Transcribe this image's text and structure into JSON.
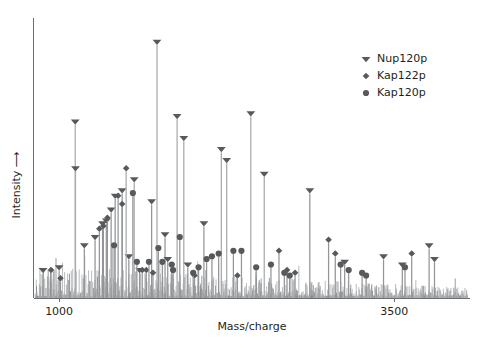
{
  "chart_data": {
    "type": "line",
    "title": "",
    "subtitle": "",
    "xlabel": "Mass/charge",
    "ylabel": "Intensity ⟶",
    "xlim": [
      820,
      4050
    ],
    "ylim": [
      0,
      100
    ],
    "grid": false,
    "xticks": [
      1000,
      3500
    ],
    "xticklabels": [
      "1000",
      "3500"
    ],
    "yticks": [],
    "yticklabels": [],
    "legend_position": "top-right",
    "legend": [
      {
        "name": "Nup120p",
        "marker": "triangle-down",
        "color": "#58595b"
      },
      {
        "name": "Kap122p",
        "marker": "diamond",
        "color": "#58595b"
      },
      {
        "name": "Kap120p",
        "marker": "circle",
        "color": "#58595b"
      }
    ],
    "series": [
      {
        "name": "Nup120p",
        "marker": "triangle-down",
        "color": "#58595b",
        "points": [
          {
            "x": 880,
            "y": 9
          },
          {
            "x": 1000,
            "y": 10
          },
          {
            "x": 1120,
            "y": 63
          },
          {
            "x": 1122,
            "y": 46
          },
          {
            "x": 1188,
            "y": 18
          },
          {
            "x": 1268,
            "y": 21
          },
          {
            "x": 1324,
            "y": 26
          },
          {
            "x": 1352,
            "y": 27
          },
          {
            "x": 1388,
            "y": 31
          },
          {
            "x": 1418,
            "y": 36
          },
          {
            "x": 1470,
            "y": 38
          },
          {
            "x": 1520,
            "y": 14
          },
          {
            "x": 1560,
            "y": 42
          },
          {
            "x": 1600,
            "y": 9
          },
          {
            "x": 1690,
            "y": 34
          },
          {
            "x": 1730,
            "y": 92
          },
          {
            "x": 1790,
            "y": 22
          },
          {
            "x": 1810,
            "y": 13
          },
          {
            "x": 1880,
            "y": 65
          },
          {
            "x": 1930,
            "y": 57
          },
          {
            "x": 1960,
            "y": 11
          },
          {
            "x": 2080,
            "y": 26
          },
          {
            "x": 2210,
            "y": 53
          },
          {
            "x": 2250,
            "y": 49
          },
          {
            "x": 2430,
            "y": 66
          },
          {
            "x": 2530,
            "y": 44
          },
          {
            "x": 2870,
            "y": 38
          },
          {
            "x": 3130,
            "y": 12
          },
          {
            "x": 3420,
            "y": 14
          },
          {
            "x": 3560,
            "y": 11
          },
          {
            "x": 3760,
            "y": 18
          },
          {
            "x": 3800,
            "y": 13
          }
        ]
      },
      {
        "name": "Kap122p",
        "marker": "diamond",
        "color": "#58595b",
        "points": [
          {
            "x": 940,
            "y": 9
          },
          {
            "x": 1010,
            "y": 6
          },
          {
            "x": 1300,
            "y": 24
          },
          {
            "x": 1330,
            "y": 25
          },
          {
            "x": 1360,
            "y": 28
          },
          {
            "x": 1440,
            "y": 36
          },
          {
            "x": 1470,
            "y": 33
          },
          {
            "x": 1500,
            "y": 46
          },
          {
            "x": 1620,
            "y": 9
          },
          {
            "x": 1650,
            "y": 9
          },
          {
            "x": 1700,
            "y": 8
          },
          {
            "x": 2010,
            "y": 7
          },
          {
            "x": 2330,
            "y": 7
          },
          {
            "x": 2640,
            "y": 16
          },
          {
            "x": 2700,
            "y": 9
          },
          {
            "x": 2760,
            "y": 8
          },
          {
            "x": 3010,
            "y": 20
          },
          {
            "x": 3060,
            "y": 15
          },
          {
            "x": 3630,
            "y": 15
          }
        ]
      },
      {
        "name": "Kap120p",
        "marker": "circle",
        "color": "#58595b",
        "points": [
          {
            "x": 1410,
            "y": 18
          },
          {
            "x": 1550,
            "y": 37
          },
          {
            "x": 1580,
            "y": 12
          },
          {
            "x": 1670,
            "y": 12
          },
          {
            "x": 1740,
            "y": 17
          },
          {
            "x": 1770,
            "y": 12
          },
          {
            "x": 1840,
            "y": 11
          },
          {
            "x": 1850,
            "y": 9
          },
          {
            "x": 1900,
            "y": 21
          },
          {
            "x": 2000,
            "y": 8
          },
          {
            "x": 2040,
            "y": 10
          },
          {
            "x": 2100,
            "y": 13
          },
          {
            "x": 2140,
            "y": 14
          },
          {
            "x": 2190,
            "y": 15
          },
          {
            "x": 2300,
            "y": 16
          },
          {
            "x": 2360,
            "y": 16
          },
          {
            "x": 2470,
            "y": 10
          },
          {
            "x": 2580,
            "y": 11
          },
          {
            "x": 2680,
            "y": 8
          },
          {
            "x": 2720,
            "y": 7
          },
          {
            "x": 3100,
            "y": 11
          },
          {
            "x": 3160,
            "y": 9
          },
          {
            "x": 3260,
            "y": 8
          },
          {
            "x": 3290,
            "y": 7
          },
          {
            "x": 3580,
            "y": 10
          }
        ]
      }
    ],
    "baseline_noise": "dense unlabeled peaks across full mass range"
  }
}
